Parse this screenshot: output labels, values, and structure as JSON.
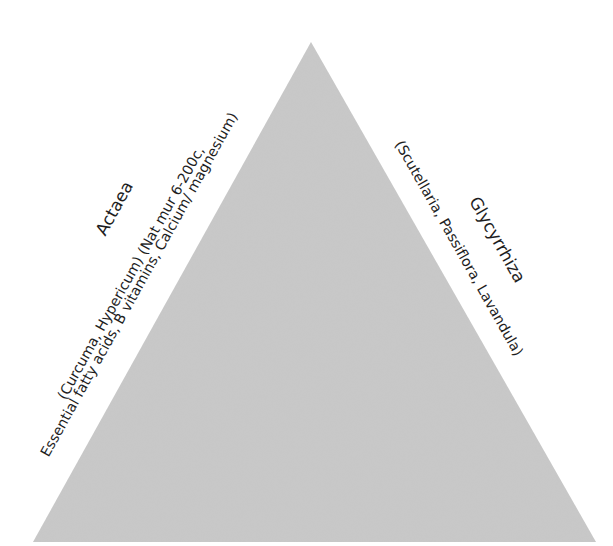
{
  "diagram": {
    "type": "triangle",
    "fill_color": "#c9c9c9",
    "background": "#ffffff",
    "vertices": {
      "apex": [
        311,
        42
      ],
      "bottom_left": [
        33,
        542
      ],
      "bottom_right": [
        596,
        542
      ]
    },
    "left_side": {
      "title": "Actaea",
      "line1": "(Curcuma, Hypericum) (Nat mur 6-200c,",
      "line2": "Essential fatty acids, B vitamins, Calcium/ magnesium)"
    },
    "right_side": {
      "title": "Glycyrrhiza",
      "line1": "(Scutellaria, Passiflora, Lavandula)"
    }
  }
}
